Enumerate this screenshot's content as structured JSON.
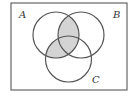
{
  "diagram": {
    "type": "venn",
    "sets": [
      {
        "id": "A",
        "label": "A"
      },
      {
        "id": "B",
        "label": "B"
      },
      {
        "id": "C",
        "label": "C"
      }
    ],
    "shaded_regions": [
      "A∩B∩¬C",
      "A∩B∩C",
      "A∩C∩¬B"
    ],
    "shaded_expression": "A ∩ (B ∪ C)",
    "colors": {
      "shade": "#d4d4d4",
      "stroke": "#555555",
      "background": "#ffffff"
    }
  }
}
